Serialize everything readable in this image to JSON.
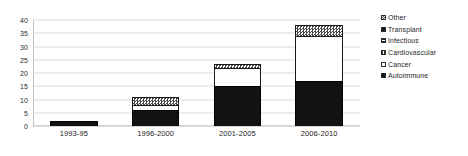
{
  "chart_data": {
    "type": "bar",
    "subtype": "stacked-column",
    "title": "",
    "xlabel": "",
    "ylabel": "",
    "ylim": [
      0,
      40
    ],
    "ytick_step": 5,
    "yticks": [
      "40",
      "35",
      "30",
      "25",
      "20",
      "15",
      "10",
      "5",
      "0"
    ],
    "grid": true,
    "legend_position": "right",
    "categories": [
      "1993-95",
      "1996-2000",
      "2001-2005",
      "2006-2010"
    ],
    "series": [
      {
        "name": "Autoimmune",
        "values": [
          2,
          6,
          15,
          17
        ]
      },
      {
        "name": "Cancer",
        "values": [
          0,
          2,
          7,
          17
        ]
      },
      {
        "name": "Cardiovascular",
        "values": [
          0,
          0,
          0,
          0
        ]
      },
      {
        "name": "Infectious",
        "values": [
          0,
          0,
          0,
          0
        ]
      },
      {
        "name": "Transplant",
        "values": [
          0,
          0,
          0,
          0
        ]
      },
      {
        "name": "Other",
        "values": [
          0,
          3,
          1.5,
          4
        ]
      }
    ],
    "totals": [
      2,
      11,
      23.5,
      38
    ]
  },
  "legend": {
    "items": [
      {
        "label": "Other",
        "swatch": "sw-other"
      },
      {
        "label": "Transplant",
        "swatch": "sw-transplant"
      },
      {
        "label": "Infectious",
        "swatch": "sw-infectious"
      },
      {
        "label": "Cardiovascular",
        "swatch": "sw-cardiovascular"
      },
      {
        "label": "Cancer",
        "swatch": "sw-cancer"
      },
      {
        "label": "Autoimmune",
        "swatch": "sw-autoimmune"
      }
    ]
  },
  "colors": {
    "axis": "#c4c4c4",
    "grid": "#d9d9d9",
    "text": "#1f1f1f",
    "autoimmune": "#121212",
    "cancer": "#ffffff",
    "other": "#4a4a4a",
    "background": "#ffffff"
  }
}
